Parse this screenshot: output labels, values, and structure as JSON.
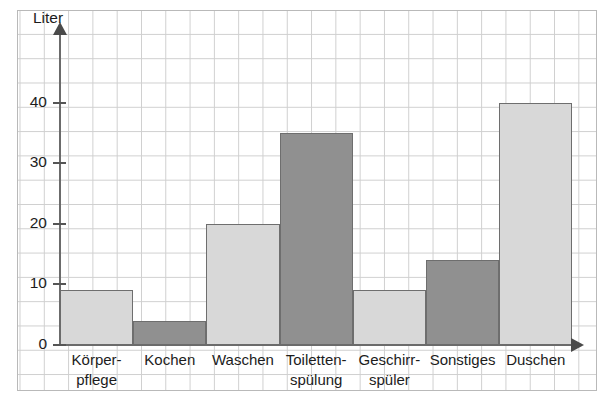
{
  "chart_data": {
    "type": "bar",
    "title": "",
    "subtitle": "",
    "xlabel": "",
    "ylabel": "Liter",
    "categories": [
      "Körper-\npflege",
      "Kochen",
      "Waschen",
      "Toiletten-\nspülung",
      "Geschirr-\nspüler",
      "Sonstiges",
      "Duschen"
    ],
    "values": [
      9,
      4,
      20,
      35,
      9,
      14,
      40
    ],
    "ylim": [
      0,
      44
    ],
    "yticks": [
      0,
      10,
      20,
      30,
      40
    ],
    "ytick_labels": [
      "0",
      "10",
      "20",
      "30",
      "40"
    ],
    "grid": true,
    "grid_minor_step": 2,
    "legend": "none",
    "bar_colors": [
      "#d8d8d8",
      "#909090",
      "#d8d8d8",
      "#909090",
      "#d8d8d8",
      "#909090",
      "#d8d8d8"
    ],
    "bar_edge_color": "#6e6e6e",
    "grid_color": "#cfcfcf",
    "axis_color": "#6b6b6b",
    "frame_color": "#b9b9b9",
    "background": "#ffffff"
  }
}
